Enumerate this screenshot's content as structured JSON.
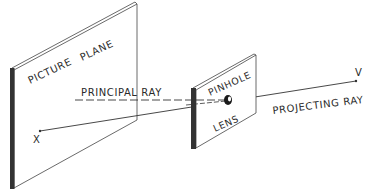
{
  "labels": {
    "picture_plane_1": "PICTURE",
    "picture_plane_2": "PLANE",
    "principal_ray": "PRINCIPAL RAY",
    "pinhole": "PINHOLE",
    "lens": "LENS",
    "projecting_ray": "PROJECTING RAY",
    "point_x": "X",
    "point_v": "V"
  },
  "colors": {
    "ink": "#2a2a2a",
    "edge": "#333333",
    "background": "#ffffff"
  }
}
